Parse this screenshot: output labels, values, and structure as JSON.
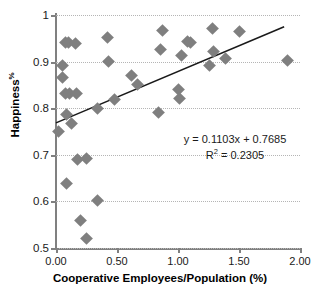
{
  "chart_data": {
    "type": "scatter",
    "title": "",
    "xlabel": "Cooperative Employees/Population (%)",
    "ylabel": "Happiness %",
    "ylabel_base": "Happiness",
    "ylabel_sup": "%",
    "xlim": [
      0.0,
      2.0
    ],
    "ylim": [
      0.5,
      1.0
    ],
    "grid": "horizontal-dotted",
    "legend": "none",
    "xticks": [
      0.0,
      0.5,
      1.0,
      1.5,
      2.0
    ],
    "xtick_labels": [
      "0.00",
      "0.50",
      "1.00",
      "1.50",
      "2.00"
    ],
    "yticks": [
      0.5,
      0.6,
      0.7,
      0.8,
      0.9,
      1.0
    ],
    "ytick_labels": [
      "0.5",
      "0.6",
      "0.7",
      "0.8",
      "0.9",
      "1"
    ],
    "marker": "diamond",
    "marker_color": "#7f7f7f",
    "points": [
      {
        "x": 0.02,
        "y": 0.75
      },
      {
        "x": 0.05,
        "y": 0.892
      },
      {
        "x": 0.05,
        "y": 0.865
      },
      {
        "x": 0.08,
        "y": 0.94
      },
      {
        "x": 0.1,
        "y": 0.94
      },
      {
        "x": 0.08,
        "y": 0.831
      },
      {
        "x": 0.11,
        "y": 0.831
      },
      {
        "x": 0.09,
        "y": 0.786
      },
      {
        "x": 0.09,
        "y": 0.638
      },
      {
        "x": 0.13,
        "y": 0.768
      },
      {
        "x": 0.16,
        "y": 0.938
      },
      {
        "x": 0.17,
        "y": 0.831
      },
      {
        "x": 0.18,
        "y": 0.689
      },
      {
        "x": 0.2,
        "y": 0.558
      },
      {
        "x": 0.25,
        "y": 0.691
      },
      {
        "x": 0.25,
        "y": 0.52
      },
      {
        "x": 0.34,
        "y": 0.8
      },
      {
        "x": 0.34,
        "y": 0.601
      },
      {
        "x": 0.42,
        "y": 0.951
      },
      {
        "x": 0.43,
        "y": 0.901
      },
      {
        "x": 0.48,
        "y": 0.818
      },
      {
        "x": 0.62,
        "y": 0.871
      },
      {
        "x": 0.67,
        "y": 0.851
      },
      {
        "x": 0.84,
        "y": 0.791
      },
      {
        "x": 0.86,
        "y": 0.926
      },
      {
        "x": 0.87,
        "y": 0.967
      },
      {
        "x": 1.0,
        "y": 0.84
      },
      {
        "x": 1.01,
        "y": 0.82
      },
      {
        "x": 1.03,
        "y": 0.913
      },
      {
        "x": 1.08,
        "y": 0.944
      },
      {
        "x": 1.1,
        "y": 0.942
      },
      {
        "x": 1.26,
        "y": 0.892
      },
      {
        "x": 1.28,
        "y": 0.972
      },
      {
        "x": 1.29,
        "y": 0.921
      },
      {
        "x": 1.39,
        "y": 0.907
      },
      {
        "x": 1.5,
        "y": 0.965
      },
      {
        "x": 1.9,
        "y": 0.902
      }
    ],
    "trendline": {
      "slope": 0.1103,
      "intercept": 0.7685,
      "r_squared": 0.2305,
      "x_start": 0.0,
      "x_end": 1.87,
      "color": "#1a1a1a",
      "equation_text": "y = 0.1103x + 0.7685",
      "r2_prefix": "R",
      "r2_sup": "2",
      "r2_text": " = 0.2305"
    }
  }
}
